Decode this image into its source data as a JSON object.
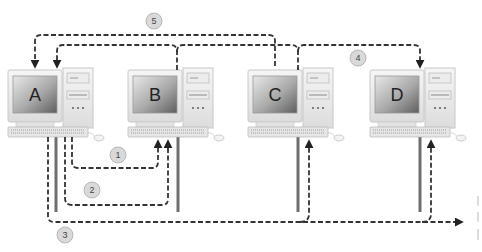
{
  "diagram": {
    "title": "",
    "nodes": [
      {
        "id": "A",
        "label": "A",
        "monitor_x": 8
      },
      {
        "id": "B",
        "label": "B",
        "monitor_x": 128
      },
      {
        "id": "C",
        "label": "C",
        "monitor_x": 248
      },
      {
        "id": "D",
        "label": "D",
        "monitor_x": 370
      }
    ],
    "paths": [
      {
        "id": "1",
        "label": "1",
        "description": "A to B (short dashed loop)"
      },
      {
        "id": "2",
        "label": "2",
        "description": "A to B (longer dashed loop)"
      },
      {
        "id": "3",
        "label": "3",
        "description": "A onto bus, delivered to C and D"
      },
      {
        "id": "4",
        "label": "4",
        "description": "B and C link to D"
      },
      {
        "id": "5",
        "label": "5",
        "description": "Links back to A and C from top"
      }
    ],
    "colors": {
      "bus": "#6e6e6e",
      "dashed_path": "#333333",
      "badge_fill": "#d9d9d9",
      "badge_stroke": "#aaaaaa",
      "monitor_body": "#f0f0f0",
      "screen_light": "#e6e6e6",
      "screen_dark": "#6a6a6a"
    }
  }
}
